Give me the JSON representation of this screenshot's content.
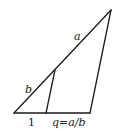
{
  "diagram": {
    "labels": {
      "a": "a",
      "b": "b",
      "one": "1",
      "q": "q=a/b"
    },
    "colors": {
      "stroke": "#1a1a1a",
      "background": "#ffffff"
    }
  }
}
